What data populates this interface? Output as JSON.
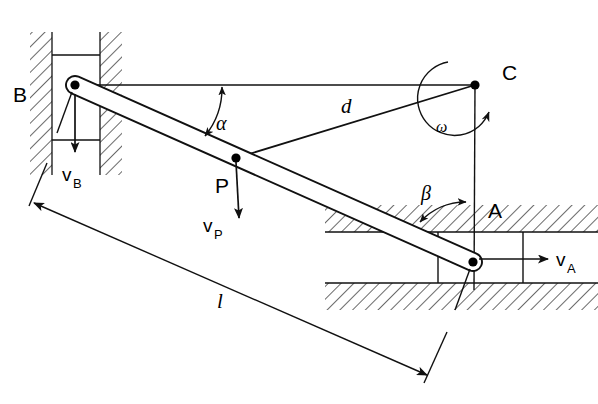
{
  "figure": {
    "type": "kinematic-mechanism-diagram",
    "background_color": "#ffffff",
    "line_color": "#111111"
  },
  "labels": {
    "point_b": "B",
    "point_c": "C",
    "point_a": "A",
    "point_p": "P",
    "velocity_b": "v",
    "velocity_b_sub": "B",
    "velocity_p": "v",
    "velocity_p_sub": "P",
    "velocity_a": "v",
    "velocity_a_sub": "A",
    "angle_alpha": "α",
    "angle_beta": "β",
    "angular_velocity": "ω",
    "length_d": "d",
    "length_l": "l"
  },
  "geometry": {
    "point_b": {
      "x": 75,
      "y": 85
    },
    "point_c": {
      "x": 475,
      "y": 85
    },
    "point_a": {
      "x": 473,
      "y": 262
    },
    "point_p": {
      "x": 236,
      "y": 158
    },
    "rod_half_width": 9,
    "vertical_guide": {
      "left_hatch_x": 30,
      "left_hatch_right": 52,
      "right_hatch_x": 100,
      "right_hatch_right": 122,
      "top_y": 32,
      "bottom_y": 175
    },
    "horizontal_guide": {
      "top_hatch_y": 205,
      "top_hatch_bottom": 232,
      "bottom_hatch_y": 283,
      "bottom_hatch_bottom": 310,
      "left_x": 325,
      "right_x": 598
    },
    "dimension_l": {
      "from_x": 32,
      "from_y": 203,
      "to_x": 427,
      "to_y": 375
    }
  },
  "annotations": {
    "alpha_arc": "double-headed arc between rod BA and horizontal line BC",
    "beta_arc": "double-headed arc between rod BA and vertical line CA",
    "omega_arc": "curved arrow about point C indicating angular velocity",
    "d_line": "straight line from P to C labelled d",
    "l_dimension": "double-arrow dimension line parallel to rod labelled l"
  }
}
